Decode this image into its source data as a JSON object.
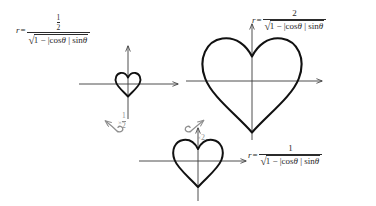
{
  "diagram": {
    "background_color": "#ffffff",
    "curve_color": "#111111",
    "axis_color": "#3a3a3a",
    "label_color": "#8f8f8f"
  },
  "formulas": {
    "top_left": {
      "lhs": "r",
      "relation": "=",
      "numerator": "1",
      "numerator_denominator": "2",
      "radicand_prefix": "1 − |",
      "radicand_cos": "cos",
      "radicand_theta": "θ",
      "radicand_mid": " | ",
      "radicand_sin": "sin",
      "radicand_theta2": "θ"
    },
    "top_right": {
      "lhs": "r",
      "relation": "=",
      "numerator": "2",
      "radicand_prefix": "1 − |",
      "radicand_cos": "cos",
      "radicand_theta": "θ",
      "radicand_mid": " | ",
      "radicand_sin": "sin",
      "radicand_theta2": "θ"
    },
    "bottom_right": {
      "lhs": "r",
      "relation": "=",
      "numerator": "1",
      "radicand_prefix": "1 − |",
      "radicand_cos": "cos",
      "radicand_theta": "θ",
      "radicand_mid": " | ",
      "radicand_sin": "sin",
      "radicand_theta2": "θ"
    }
  },
  "operations": {
    "scale_half": {
      "symbol": "×",
      "numerator": "1",
      "denominator": "2",
      "direction": "up-left"
    },
    "scale_two": {
      "symbol": "×",
      "factor": "2",
      "direction": "up-right"
    }
  },
  "plots": [
    {
      "name": "small-heart-plot",
      "scale": "1/2",
      "origin": {
        "x": 128,
        "y": 84
      },
      "radius": 13
    },
    {
      "name": "large-heart-plot",
      "scale": "2",
      "origin": {
        "x": 252,
        "y": 81
      },
      "radius": 52
    },
    {
      "name": "base-heart-plot",
      "scale": "1",
      "origin": {
        "x": 198,
        "y": 161
      },
      "radius": 26
    }
  ]
}
